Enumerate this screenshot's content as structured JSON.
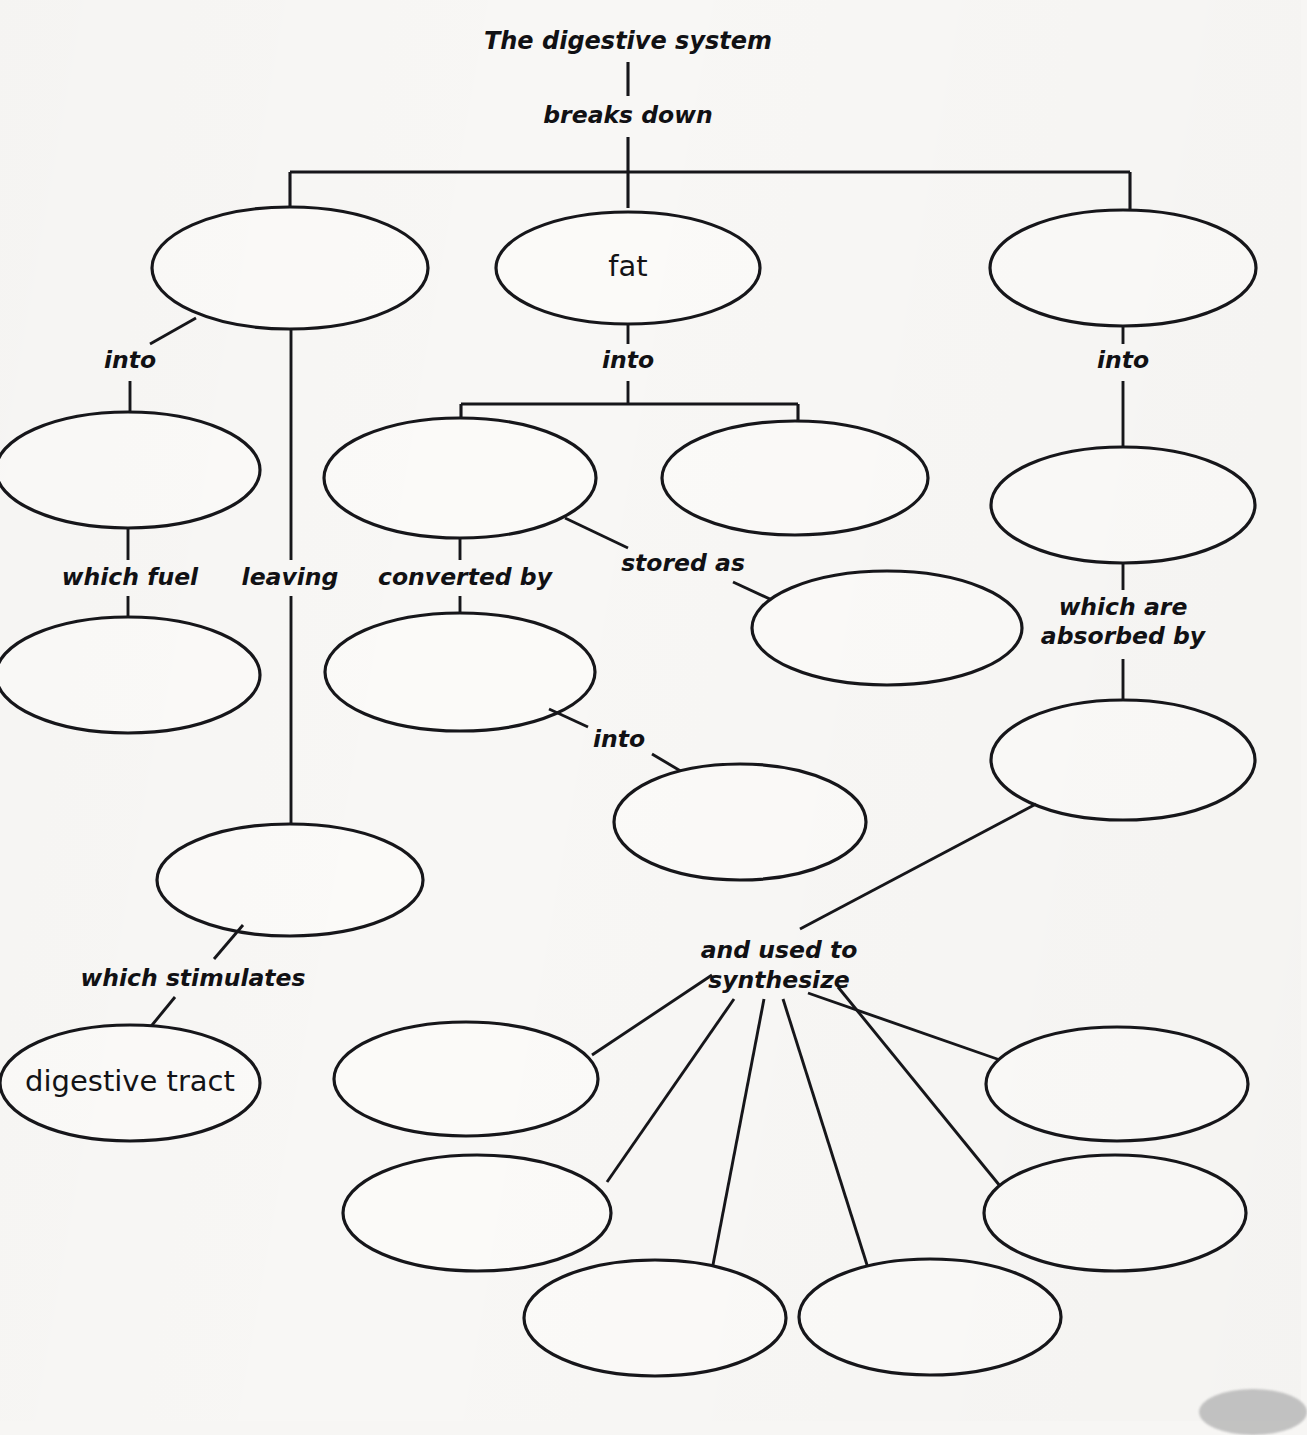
{
  "diagram": {
    "title": "The digestive system",
    "type": "concept-map",
    "background_color": "#f8f7f5",
    "ink_color": "#16161a",
    "root": {
      "text": "The digestive system",
      "relation_to_children": "breaks down"
    },
    "relations": {
      "breaks_down": "breaks down",
      "into": "into",
      "which_fuel": "which fuel",
      "leaving": "leaving",
      "converted_by": "converted by",
      "stored_as": "stored as",
      "which_are_absorbed_by": "which are\nabsorbed by",
      "which_are_absorbed_by_line1": "which are",
      "which_are_absorbed_by_line2": "absorbed by",
      "which_stimulates": "which stimulates",
      "and_used_to_synthesize_line1": "and used to",
      "and_used_to_synthesize_line2": "synthesize"
    },
    "nodes": [
      {
        "id": "n-carbohydrate",
        "label": "",
        "filled": false,
        "cx": 290,
        "cy": 268,
        "rx": 138,
        "ry": 61
      },
      {
        "id": "n-fat",
        "label": "fat",
        "filled": true,
        "cx": 628,
        "cy": 268,
        "rx": 132,
        "ry": 56
      },
      {
        "id": "n-protein",
        "label": "",
        "filled": false,
        "cx": 1123,
        "cy": 268,
        "rx": 133,
        "ry": 58
      },
      {
        "id": "n-sugars",
        "label": "",
        "filled": false,
        "cx": 128,
        "cy": 470,
        "rx": 132,
        "ry": 58
      },
      {
        "id": "n-cells",
        "label": "",
        "filled": false,
        "cx": 128,
        "cy": 675,
        "rx": 132,
        "ry": 58
      },
      {
        "id": "n-fatty-acids",
        "label": "",
        "filled": false,
        "cx": 460,
        "cy": 478,
        "rx": 136,
        "ry": 60
      },
      {
        "id": "n-glycerol",
        "label": "",
        "filled": false,
        "cx": 795,
        "cy": 478,
        "rx": 133,
        "ry": 57
      },
      {
        "id": "n-adipose",
        "label": "",
        "filled": false,
        "cx": 887,
        "cy": 628,
        "rx": 135,
        "ry": 57
      },
      {
        "id": "n-liver",
        "label": "",
        "filled": false,
        "cx": 460,
        "cy": 672,
        "rx": 135,
        "ry": 59
      },
      {
        "id": "n-ketones",
        "label": "",
        "filled": false,
        "cx": 740,
        "cy": 822,
        "rx": 126,
        "ry": 58
      },
      {
        "id": "n-amino-acids",
        "label": "",
        "filled": false,
        "cx": 1123,
        "cy": 505,
        "rx": 132,
        "ry": 58
      },
      {
        "id": "n-blood",
        "label": "",
        "filled": false,
        "cx": 1123,
        "cy": 760,
        "rx": 132,
        "ry": 60
      },
      {
        "id": "n-fiber",
        "label": "",
        "filled": false,
        "cx": 290,
        "cy": 880,
        "rx": 133,
        "ry": 56
      },
      {
        "id": "n-digestive-tract",
        "label": "digestive tract",
        "filled": true,
        "cx": 130,
        "cy": 1083,
        "rx": 130,
        "ry": 58
      },
      {
        "id": "n-synth-1",
        "label": "",
        "filled": false,
        "cx": 466,
        "cy": 1079,
        "rx": 132,
        "ry": 57
      },
      {
        "id": "n-synth-2",
        "label": "",
        "filled": false,
        "cx": 477,
        "cy": 1213,
        "rx": 134,
        "ry": 58
      },
      {
        "id": "n-synth-3",
        "label": "",
        "filled": false,
        "cx": 655,
        "cy": 1318,
        "rx": 131,
        "ry": 58
      },
      {
        "id": "n-synth-4",
        "label": "",
        "filled": false,
        "cx": 930,
        "cy": 1317,
        "rx": 131,
        "ry": 58
      },
      {
        "id": "n-synth-5",
        "label": "",
        "filled": false,
        "cx": 1117,
        "cy": 1084,
        "rx": 131,
        "ry": 57
      },
      {
        "id": "n-synth-6",
        "label": "",
        "filled": false,
        "cx": 1115,
        "cy": 1213,
        "rx": 131,
        "ry": 58
      }
    ],
    "link_labels": [
      {
        "id": "lbl-breaks-down",
        "text": "breaks down",
        "x": 628,
        "y": 116
      },
      {
        "id": "lbl-into-left",
        "text": "into",
        "x": 130,
        "y": 361
      },
      {
        "id": "lbl-into-mid",
        "text": "into",
        "x": 628,
        "y": 361
      },
      {
        "id": "lbl-into-right",
        "text": "into",
        "x": 1123,
        "y": 361
      },
      {
        "id": "lbl-which-fuel",
        "text": "which fuel",
        "x": 130,
        "y": 578
      },
      {
        "id": "lbl-leaving",
        "text": "leaving",
        "x": 290,
        "y": 578
      },
      {
        "id": "lbl-converted-by",
        "text": "converted by",
        "x": 465,
        "y": 578
      },
      {
        "id": "lbl-stored-as",
        "text": "stored as",
        "x": 683,
        "y": 564
      },
      {
        "id": "lbl-into-liver",
        "text": "into",
        "x": 619,
        "y": 740
      },
      {
        "id": "lbl-absorbed-1",
        "text": "which are",
        "x": 1123,
        "y": 608
      },
      {
        "id": "lbl-absorbed-2",
        "text": "absorbed by",
        "x": 1123,
        "y": 637
      },
      {
        "id": "lbl-stimulates",
        "text": "which stimulates",
        "x": 193,
        "y": 979
      },
      {
        "id": "lbl-synth-1",
        "text": "and used to",
        "x": 779,
        "y": 951
      },
      {
        "id": "lbl-synth-2",
        "text": "synthesize",
        "x": 779,
        "y": 981
      }
    ]
  }
}
